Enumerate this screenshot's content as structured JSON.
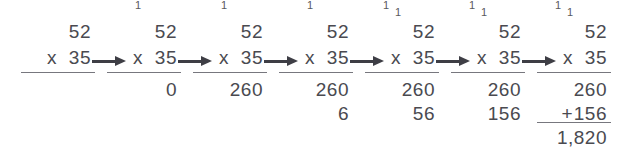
{
  "figure": {
    "background_color": "#ffffff",
    "ink_color": "#4a4a50",
    "rule_color": "#77777e",
    "arrow_color": "#3e3e45",
    "multiplicand": "52",
    "multiplier": "35",
    "operator_multiply": "x",
    "operator_add": "+",
    "final_product": "1,820"
  },
  "steps": [
    {
      "index": 1,
      "x": 62,
      "carries": [],
      "multiplicand": "52",
      "multiplier": "35",
      "multiply_operator": "x",
      "show_mul_rule": true,
      "partial1": "",
      "partial2": "",
      "add_operator": "",
      "show_sum_rule": false,
      "total": ""
    },
    {
      "index": 2,
      "x": 148,
      "carries": [
        {
          "value": "1",
          "position": "hi",
          "left": 30
        }
      ],
      "multiplicand": "52",
      "multiplier": "35",
      "multiply_operator": "x",
      "show_mul_rule": true,
      "partial1": "0",
      "partial2": "",
      "add_operator": "",
      "show_sum_rule": false,
      "total": ""
    },
    {
      "index": 3,
      "x": 234,
      "carries": [
        {
          "value": "1",
          "position": "hi",
          "left": 30
        }
      ],
      "multiplicand": "52",
      "multiplier": "35",
      "multiply_operator": "x",
      "show_mul_rule": true,
      "partial1": "260",
      "partial2": "",
      "add_operator": "",
      "show_sum_rule": false,
      "total": ""
    },
    {
      "index": 4,
      "x": 320,
      "carries": [
        {
          "value": "1",
          "position": "hi",
          "left": 30
        }
      ],
      "multiplicand": "52",
      "multiplier": "35",
      "multiply_operator": "x",
      "show_mul_rule": true,
      "partial1": "260",
      "partial2": "6",
      "add_operator": "",
      "show_sum_rule": false,
      "total": ""
    },
    {
      "index": 5,
      "x": 406,
      "carries": [
        {
          "value": "1",
          "position": "hi",
          "left": 20
        },
        {
          "value": "1",
          "position": "lo",
          "left": 32
        }
      ],
      "multiplicand": "52",
      "multiplier": "35",
      "multiply_operator": "x",
      "show_mul_rule": true,
      "partial1": "260",
      "partial2": "56",
      "add_operator": "",
      "show_sum_rule": false,
      "total": ""
    },
    {
      "index": 6,
      "x": 492,
      "carries": [
        {
          "value": "1",
          "position": "hi",
          "left": 20
        },
        {
          "value": "1",
          "position": "lo",
          "left": 32
        }
      ],
      "multiplicand": "52",
      "multiplier": "35",
      "multiply_operator": "x",
      "show_mul_rule": true,
      "partial1": "260",
      "partial2": "156",
      "add_operator": "",
      "show_sum_rule": false,
      "total": ""
    },
    {
      "index": 7,
      "x": 578,
      "carries": [
        {
          "value": "1",
          "position": "hi",
          "left": 20
        },
        {
          "value": "1",
          "position": "lo",
          "left": 32
        }
      ],
      "multiplicand": "52",
      "multiplier": "35",
      "multiply_operator": "x",
      "show_mul_rule": true,
      "partial1": "260",
      "partial2": "156",
      "add_operator": "+",
      "show_sum_rule": true,
      "total": "1,820"
    }
  ],
  "arrows": [
    {
      "index": 1,
      "x": 92
    },
    {
      "index": 2,
      "x": 178
    },
    {
      "index": 3,
      "x": 264
    },
    {
      "index": 4,
      "x": 350
    },
    {
      "index": 5,
      "x": 436
    },
    {
      "index": 6,
      "x": 522
    }
  ]
}
